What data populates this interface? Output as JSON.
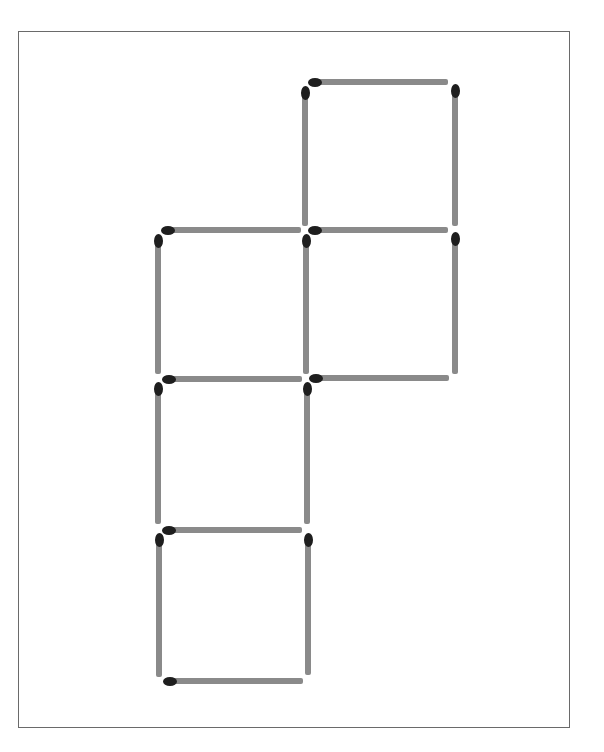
{
  "puzzle": {
    "type": "matchstick-diagram",
    "match_count": 16,
    "squares": 5,
    "colors": {
      "stick": "#8a8a8a",
      "head": "#1e1e1e",
      "frame": "#6a6a6a",
      "background": "#ffffff"
    },
    "matches": [
      {
        "id": "top-h-1",
        "orientation": "h",
        "x": 312,
        "y": 79,
        "length": 136
      },
      {
        "id": "top-v-left",
        "orientation": "v",
        "x": 302,
        "y": 90,
        "length": 136
      },
      {
        "id": "top-v-right",
        "orientation": "v",
        "x": 452,
        "y": 88,
        "length": 138
      },
      {
        "id": "row2-h-left",
        "orientation": "h",
        "x": 165,
        "y": 227,
        "length": 136
      },
      {
        "id": "row2-h-right",
        "orientation": "h",
        "x": 312,
        "y": 227,
        "length": 136
      },
      {
        "id": "row2-v-left",
        "orientation": "v",
        "x": 155,
        "y": 238,
        "length": 136
      },
      {
        "id": "row2-v-mid",
        "orientation": "v",
        "x": 303,
        "y": 238,
        "length": 136
      },
      {
        "id": "row2-v-right",
        "orientation": "v",
        "x": 452,
        "y": 236,
        "length": 138
      },
      {
        "id": "row3-h-left",
        "orientation": "h",
        "x": 166,
        "y": 376,
        "length": 136
      },
      {
        "id": "row3-h-right",
        "orientation": "h",
        "x": 313,
        "y": 375,
        "length": 136
      },
      {
        "id": "row3-v-left",
        "orientation": "v",
        "x": 155,
        "y": 386,
        "length": 138
      },
      {
        "id": "row3-v-mid",
        "orientation": "v",
        "x": 304,
        "y": 386,
        "length": 138
      },
      {
        "id": "row4-h",
        "orientation": "h",
        "x": 166,
        "y": 527,
        "length": 136
      },
      {
        "id": "row4-v-left",
        "orientation": "v",
        "x": 156,
        "y": 537,
        "length": 140
      },
      {
        "id": "row4-v-right",
        "orientation": "v",
        "x": 305,
        "y": 537,
        "length": 138
      },
      {
        "id": "bottom-h",
        "orientation": "h",
        "x": 167,
        "y": 678,
        "length": 136
      }
    ]
  }
}
